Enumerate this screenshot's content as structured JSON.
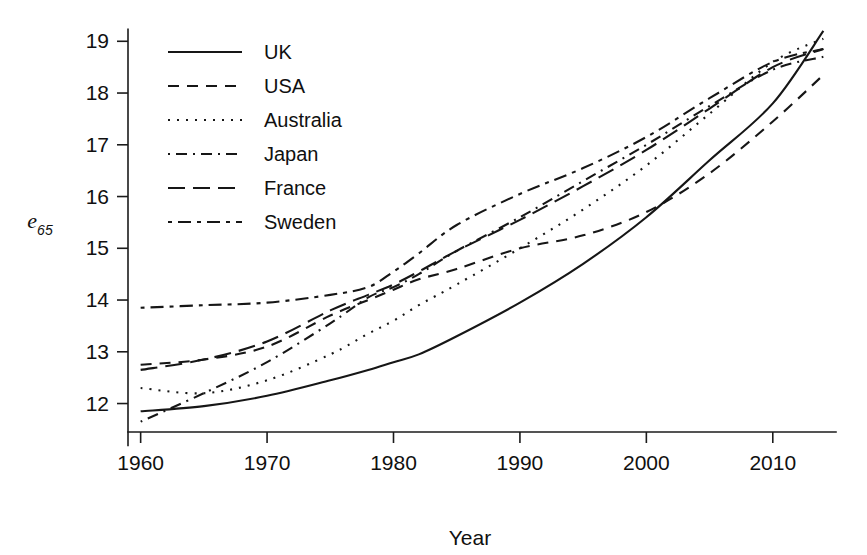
{
  "chart_data": {
    "type": "line",
    "title": "",
    "xlabel": "Year",
    "ylabel": "e65",
    "ylabel_base": "e",
    "ylabel_sub": "65",
    "xlim": [
      1959,
      2015
    ],
    "ylim": [
      11.45,
      19.45
    ],
    "xticks": [
      1960,
      1970,
      1980,
      1990,
      2000,
      2010
    ],
    "xtick_labels": [
      "1960",
      "1970",
      "1980",
      "1990",
      "2000",
      "2010"
    ],
    "yticks": [
      12,
      13,
      14,
      15,
      16,
      17,
      18,
      19
    ],
    "ytick_labels": [
      "12",
      "13",
      "14",
      "15",
      "16",
      "17",
      "18",
      "19"
    ],
    "grid": false,
    "legend_position": "top-left",
    "x": [
      1960,
      1965,
      1970,
      1975,
      1978,
      1980,
      1982,
      1985,
      1990,
      1995,
      2000,
      2005,
      2010,
      2014
    ],
    "series": [
      {
        "name": "UK",
        "dash": "solid",
        "dasharray": "none",
        "color": "#161616",
        "values": [
          11.85,
          11.95,
          12.15,
          12.45,
          12.65,
          12.8,
          12.95,
          13.3,
          13.95,
          14.7,
          15.6,
          16.7,
          17.8,
          19.2
        ]
      },
      {
        "name": "USA",
        "dash": "dashed",
        "dasharray": "11,8",
        "color": "#161616",
        "values": [
          12.75,
          12.85,
          13.1,
          13.7,
          14.0,
          14.2,
          14.4,
          14.6,
          15.0,
          15.25,
          15.7,
          16.45,
          17.45,
          18.35
        ]
      },
      {
        "name": "Australia",
        "dash": "dotted",
        "dasharray": "2,7",
        "color": "#161616",
        "values": [
          12.3,
          12.2,
          12.45,
          12.95,
          13.35,
          13.6,
          13.9,
          14.3,
          15.0,
          15.75,
          16.6,
          17.6,
          18.6,
          19.05
        ]
      },
      {
        "name": "Japan",
        "dash": "dashdot",
        "dasharray": "2,6,11,6",
        "color": "#161616",
        "values": [
          11.65,
          12.2,
          12.8,
          13.55,
          14.05,
          14.25,
          14.5,
          14.95,
          15.6,
          16.3,
          17.0,
          17.75,
          18.45,
          18.7
        ]
      },
      {
        "name": "France",
        "dash": "longdash",
        "dasharray": "17,8",
        "color": "#161616",
        "values": [
          12.65,
          12.85,
          13.2,
          13.8,
          14.1,
          14.3,
          14.55,
          14.95,
          15.55,
          16.2,
          16.9,
          17.7,
          18.5,
          18.85
        ]
      },
      {
        "name": "Sweden",
        "dash": "twodash",
        "dasharray": "4,6,13,6",
        "color": "#161616",
        "values": [
          13.85,
          13.9,
          13.95,
          14.1,
          14.25,
          14.55,
          14.9,
          15.45,
          16.05,
          16.55,
          17.15,
          17.9,
          18.6,
          18.85
        ]
      }
    ]
  },
  "legend": {
    "entries": [
      {
        "label": "UK"
      },
      {
        "label": "USA"
      },
      {
        "label": "Australia"
      },
      {
        "label": "Japan"
      },
      {
        "label": "France"
      },
      {
        "label": "Sweden"
      }
    ]
  }
}
